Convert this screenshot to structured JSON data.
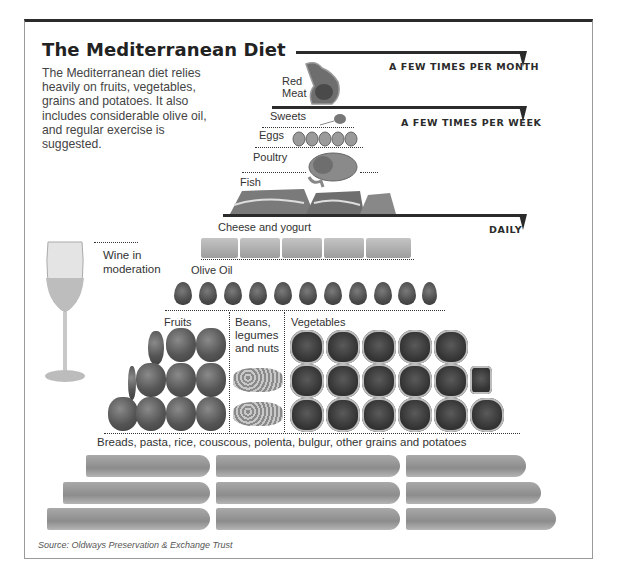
{
  "title": "The Mediterranean Diet",
  "description": "The Mediterranean diet relies heavily on fruits, vegetables, grains and potatoes. It also includes considerable olive oil, and regular exercise is suggested.",
  "frequencies": {
    "month": "A FEW TIMES PER MONTH",
    "week": "A FEW TIMES PER WEEK",
    "daily": "DAILY"
  },
  "tiers": {
    "red_meat": "Red\nMeat",
    "red_meat_line1": "Red",
    "red_meat_line2": "Meat",
    "sweets": "Sweets",
    "eggs": "Eggs",
    "poultry": "Poultry",
    "fish": "Fish",
    "cheese": "Cheese and yogurt",
    "olive_oil": "Olive Oil",
    "fruits": "Fruits",
    "beans_line1": "Beans,",
    "beans_line2": "legumes",
    "beans_line3": "and nuts",
    "vegetables": "Vegetables",
    "grains": "Breads, pasta, rice, couscous, polenta, bulgur, other grains and potatoes"
  },
  "wine": {
    "line1": "Wine in",
    "line2": "moderation"
  },
  "counts": {
    "eggs": 5,
    "cheese_blocks": 7,
    "olives": 11,
    "fruit_rows": [
      3,
      4,
      4
    ],
    "bean_piles": 2,
    "vegetable_rows": [
      5,
      6,
      6
    ],
    "bread_rows": 3,
    "bread_per_row": 3
  },
  "source": "Source: Oldways Preservation & Exchange Trust",
  "colors": {
    "rule": "#2b2b2b",
    "text": "#333333"
  }
}
